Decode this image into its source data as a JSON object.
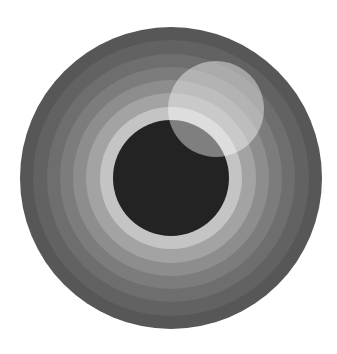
{
  "artwork": {
    "background": "#ffffff",
    "center": [
      171,
      178
    ],
    "outer_radius": 151,
    "rings": [
      {
        "radius": 151,
        "color": "#575757"
      },
      {
        "radius": 138,
        "color": "#626262"
      },
      {
        "radius": 124,
        "color": "#6e6e6e"
      },
      {
        "radius": 111,
        "color": "#7c7c7c"
      },
      {
        "radius": 98,
        "color": "#8d8d8d"
      },
      {
        "radius": 85,
        "color": "#a3a3a3"
      },
      {
        "radius": 71,
        "color": "#c4c4c4"
      }
    ],
    "core": {
      "radius": 58,
      "color": "#232323"
    },
    "highlight": {
      "cx": 216,
      "cy": 109,
      "r": 48,
      "color": "#ffffff",
      "opacity": 0.42
    }
  }
}
